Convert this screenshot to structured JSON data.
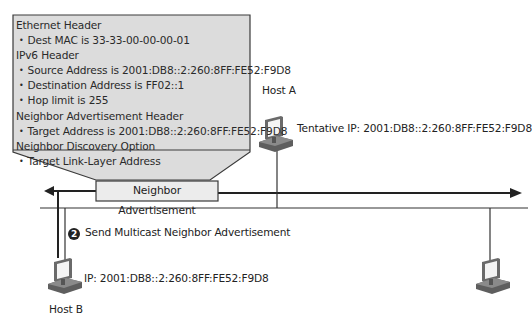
{
  "callout": {
    "sections": [
      {
        "header": "Ethernet Header",
        "items": [
          "Dest MAC is 33-33-00-00-00-01"
        ]
      },
      {
        "header": "IPv6 Header",
        "items": [
          "Source Address is 2001:DB8::2:260:8FF:FE52:F9D8",
          "Destination Address is FF02::1",
          "Hop limit is 255"
        ]
      },
      {
        "header": "Neighbor Advertisement Header",
        "items": [
          "Target Address is 2001:DB8::2:260:8FF:FE52:F9D8"
        ]
      },
      {
        "header": "Neighbor Discovery Option",
        "items": [
          "Target Link-Layer Address"
        ]
      }
    ]
  },
  "packet": {
    "label": "Neighbor Advertisement"
  },
  "hosts": {
    "host_a": {
      "name": "Host A",
      "ip_label": "Tentative IP: 2001:DB8::2:260:8FF:FE52:F9D8"
    },
    "host_b": {
      "name": "Host B",
      "ip_label": "IP: 2001:DB8::2:260:8FF:FE52:F9D8"
    },
    "host_c": {
      "name": ""
    }
  },
  "step": {
    "number": "2",
    "label": "Send Multicast Neighbor Advertisement"
  },
  "colors": {
    "callout_fill": "#dcdcdc",
    "callout_border": "#3a3a3a",
    "line": "#222222",
    "computer_body": "#6e6e6e",
    "computer_screen": "#f2f2f2"
  }
}
